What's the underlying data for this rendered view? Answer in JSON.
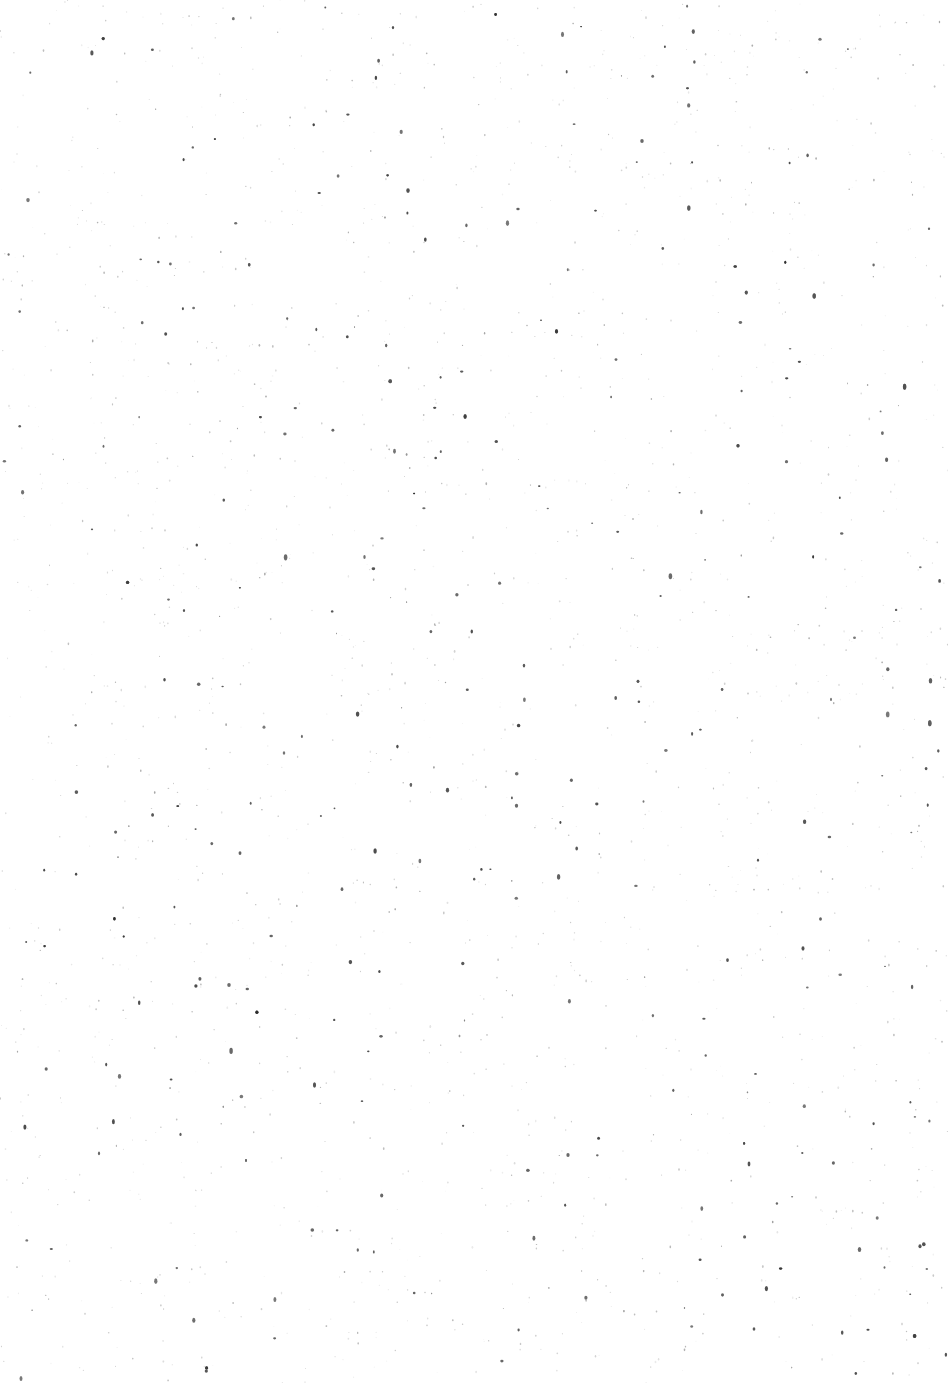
{
  "page": {
    "background": "#ffffff",
    "text_blocks": []
  }
}
